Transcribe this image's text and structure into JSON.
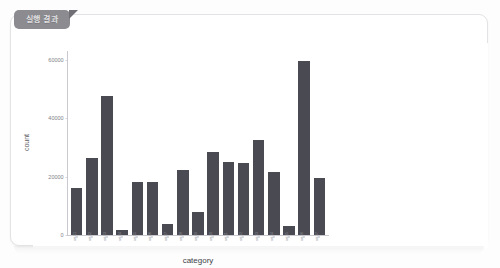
{
  "panel": {
    "tab_label": "실행 결과"
  },
  "chart_data": {
    "type": "bar",
    "title": "",
    "xlabel": "category",
    "ylabel": "count",
    "ylim": [
      0,
      63000
    ],
    "yticks": [
      0,
      20000,
      40000,
      60000
    ],
    "ytick_labels": [
      "0",
      "20000",
      "40000",
      "60000"
    ],
    "grid": false,
    "legend": false,
    "bar_color": "#4a4a52",
    "categories": [
      "cat-01",
      "cat-02",
      "cat-03",
      "cat-04",
      "cat-05",
      "cat-06",
      "cat-07",
      "cat-08",
      "cat-09",
      "cat-10",
      "cat-11",
      "cat-12",
      "cat-13",
      "cat-14",
      "cat-15",
      "cat-16"
    ],
    "tick_labels_legible": false,
    "values": [
      16000,
      26500,
      47500,
      1800,
      18000,
      18000,
      3800,
      22200,
      7800,
      28500,
      25000,
      24500,
      32500,
      21500,
      3000,
      59500
    ],
    "values_last": 19500
  }
}
